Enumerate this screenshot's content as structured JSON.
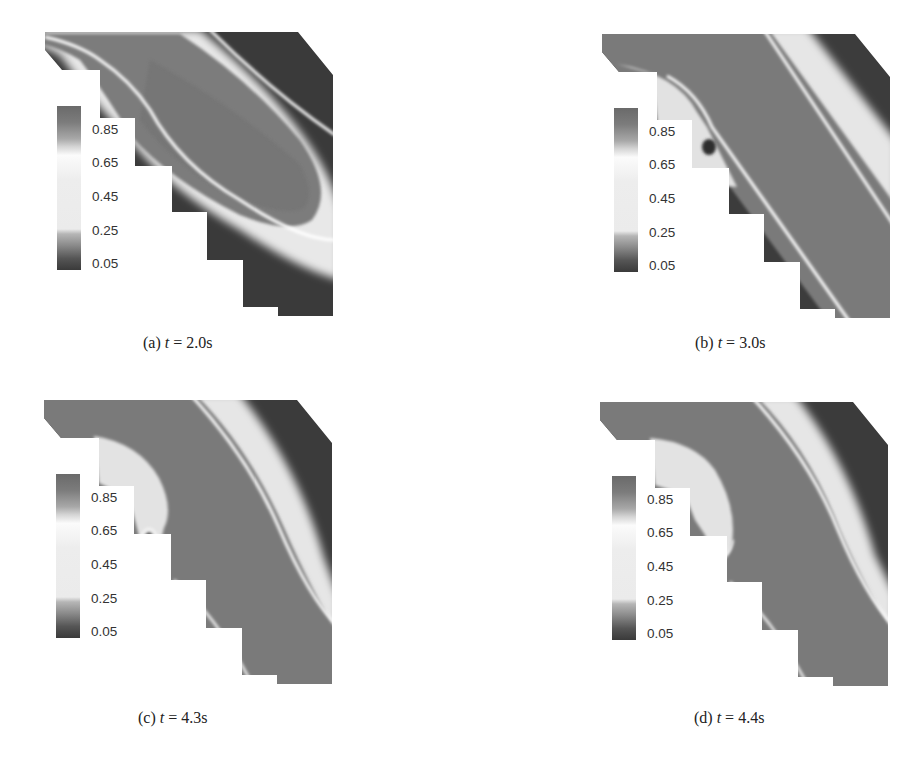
{
  "figure": {
    "colorbar": {
      "ticks": [
        "0.85",
        "0.65",
        "0.45",
        "0.25",
        "0.05"
      ],
      "colors": {
        "high": "#6e6e6e",
        "mid_high": "#bdbdbd",
        "mid": "#f4f4f4",
        "mid_low": "#9a9a9a",
        "low": "#3a3a3a"
      }
    },
    "panels": [
      {
        "id": "a",
        "label": "(a)",
        "var": "t",
        "eq": "=",
        "value": "2.0s"
      },
      {
        "id": "b",
        "label": "(b)",
        "var": "t",
        "eq": "=",
        "value": "3.0s"
      },
      {
        "id": "c",
        "label": "(c)",
        "var": "t",
        "eq": "=",
        "value": "4.3s"
      },
      {
        "id": "d",
        "label": "(d)",
        "var": "t",
        "eq": "=",
        "value": "4.4s"
      }
    ],
    "field_colors": {
      "fluid_dark": "#3b3b3b",
      "fluid_medium": "#7a7a7a",
      "interface_light": "#ececec",
      "interface_white": "#ffffff"
    }
  }
}
